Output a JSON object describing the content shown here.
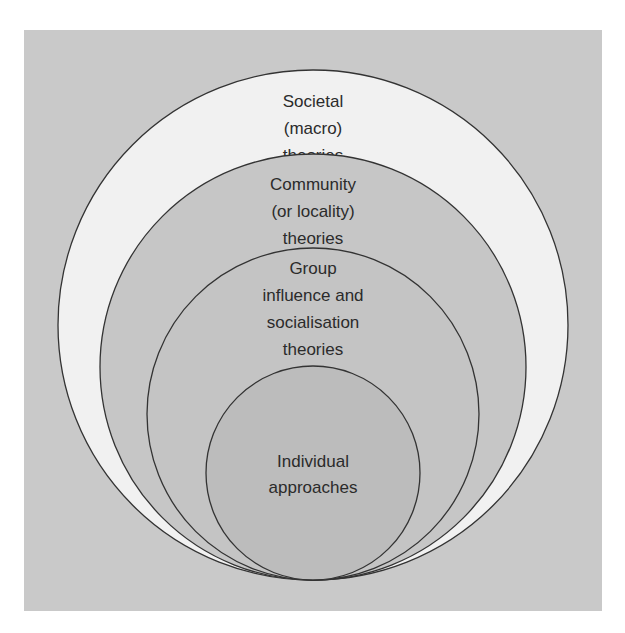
{
  "diagram": {
    "type": "nested-circles",
    "background_color": "#c9c9c9",
    "outline_color": "#333333",
    "levels": [
      {
        "id": "societal",
        "lines": [
          "Societal",
          "(macro)",
          "theories"
        ],
        "fill": "#f1f1f1"
      },
      {
        "id": "community",
        "lines": [
          "Community",
          "(or locality)",
          "theories"
        ],
        "fill": "#c6c6c6"
      },
      {
        "id": "group",
        "lines": [
          "Group",
          "influence and",
          "socialisation",
          "theories"
        ],
        "fill": "#c4c4c4"
      },
      {
        "id": "individual",
        "lines": [
          "Individual",
          "approaches"
        ],
        "fill": "#bcbcbc"
      }
    ]
  }
}
